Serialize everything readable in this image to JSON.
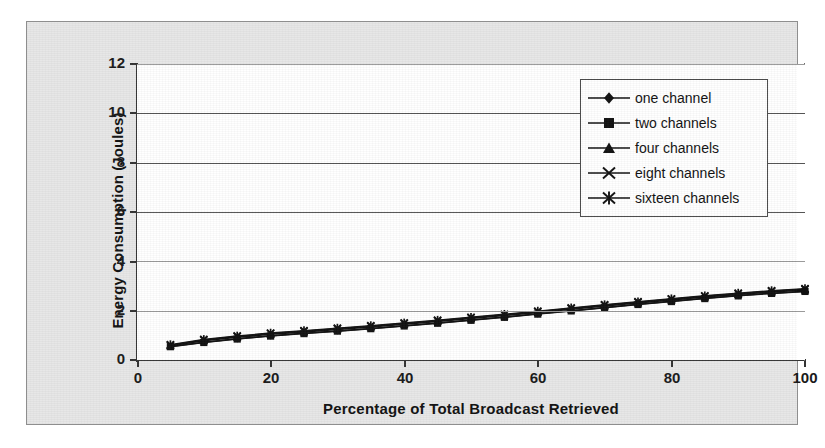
{
  "chart_data": {
    "type": "line",
    "title": "",
    "xlabel": "Percentage of Total Broadcast Retrieved",
    "ylabel": "Energy Consumption (Joules)",
    "xlim": [
      0,
      100
    ],
    "ylim": [
      0,
      12
    ],
    "xticks": [
      0,
      20,
      40,
      60,
      80,
      100
    ],
    "yticks": [
      0,
      2,
      4,
      6,
      8,
      10,
      12
    ],
    "grid": "horizontal",
    "legend_position": "upper-right-inside",
    "x": [
      5,
      10,
      15,
      20,
      25,
      30,
      35,
      40,
      45,
      50,
      55,
      60,
      65,
      70,
      75,
      80,
      85,
      90,
      95,
      100
    ],
    "series": [
      {
        "name": "one channel",
        "marker": "diamond",
        "values": [
          0.55,
          0.72,
          0.86,
          0.98,
          1.08,
          1.18,
          1.28,
          1.39,
          1.5,
          1.62,
          1.74,
          1.87,
          2.0,
          2.13,
          2.26,
          2.38,
          2.5,
          2.61,
          2.71,
          2.79
        ]
      },
      {
        "name": "two channels",
        "marker": "square",
        "values": [
          0.54,
          0.71,
          0.85,
          0.97,
          1.07,
          1.17,
          1.27,
          1.38,
          1.49,
          1.61,
          1.73,
          1.86,
          1.99,
          2.12,
          2.25,
          2.37,
          2.49,
          2.6,
          2.7,
          2.78
        ]
      },
      {
        "name": "four channels",
        "marker": "triangle",
        "values": [
          0.58,
          0.78,
          0.92,
          1.04,
          1.14,
          1.24,
          1.34,
          1.45,
          1.56,
          1.68,
          1.8,
          1.93,
          2.06,
          2.19,
          2.31,
          2.43,
          2.55,
          2.66,
          2.76,
          2.84
        ]
      },
      {
        "name": "eight channels",
        "marker": "x",
        "values": [
          0.6,
          0.81,
          0.95,
          1.07,
          1.17,
          1.27,
          1.37,
          1.48,
          1.59,
          1.71,
          1.83,
          1.96,
          2.09,
          2.22,
          2.34,
          2.46,
          2.58,
          2.69,
          2.79,
          2.87
        ]
      },
      {
        "name": "sixteen channels",
        "marker": "asterisk",
        "values": [
          0.62,
          0.83,
          0.97,
          1.09,
          1.19,
          1.29,
          1.39,
          1.5,
          1.61,
          1.73,
          1.85,
          1.98,
          2.11,
          2.24,
          2.36,
          2.48,
          2.6,
          2.71,
          2.81,
          2.89
        ]
      }
    ]
  },
  "axes": {
    "ylabel": "Energy Consumption (Joules)",
    "xlabel": "Percentage of Total Broadcast Retrieved",
    "ytick_labels": [
      "12",
      "10",
      "8",
      "6",
      "4",
      "2",
      "0"
    ],
    "xtick_labels": [
      "0",
      "20",
      "40",
      "60",
      "80",
      "100"
    ]
  },
  "legend": {
    "items": [
      {
        "label": "one channel",
        "marker": "diamond-marker-icon"
      },
      {
        "label": "two channels",
        "marker": "square-marker-icon"
      },
      {
        "label": "four channels",
        "marker": "triangle-marker-icon"
      },
      {
        "label": "eight channels",
        "marker": "x-marker-icon"
      },
      {
        "label": "sixteen channels",
        "marker": "asterisk-marker-icon"
      }
    ]
  },
  "colors": {
    "series": "#111111",
    "grid": "#555555",
    "axis": "#333333",
    "frame_background": "#e7e7e7",
    "plot_background": "#ffffff"
  }
}
